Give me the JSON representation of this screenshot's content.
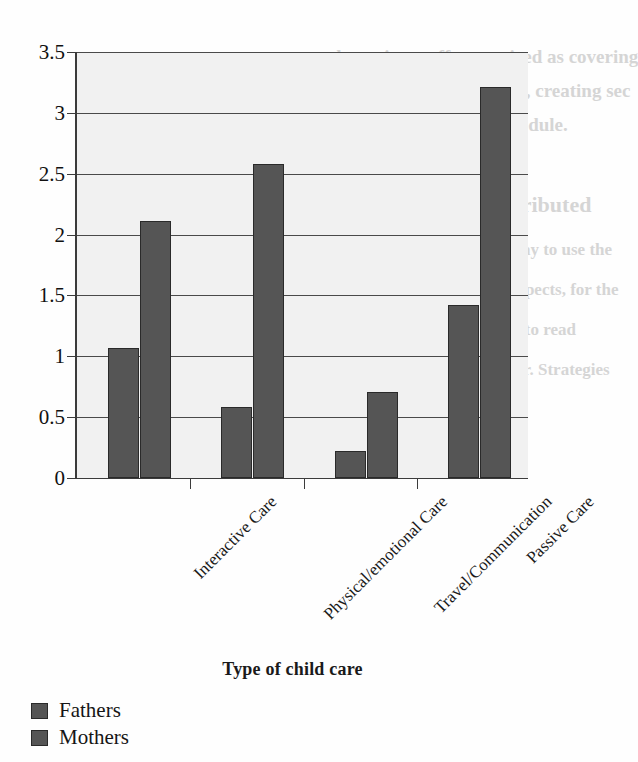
{
  "chart_data": {
    "type": "bar",
    "title": "",
    "xlabel": "Type of child care",
    "ylabel": "",
    "categories": [
      "Interactive Care",
      "Physical/emotional Care",
      "Travel/Communication",
      "Passive Care"
    ],
    "series": [
      {
        "name": "Fathers",
        "values": [
          1.07,
          0.58,
          0.22,
          1.42
        ]
      },
      {
        "name": "Mothers",
        "values": [
          2.11,
          2.58,
          0.71,
          3.21
        ]
      }
    ],
    "ylim": [
      0,
      3.5
    ],
    "ytick_labels": [
      "0",
      "0.5",
      "1",
      "1.5",
      "2",
      "2.5",
      "3",
      "3.5"
    ],
    "ytick_values": [
      0,
      0.5,
      1,
      1.5,
      2,
      2.5,
      3,
      3.5
    ],
    "grid": true,
    "legend_position": "bottom-left",
    "bar_color": "#555555",
    "plot_background": "#f1f1f1",
    "axis_color": "#3b3b3b"
  },
  "legend": {
    "items": [
      {
        "label": "Fathers"
      },
      {
        "label": "Mothers"
      }
    ]
  },
  "axis": {
    "x_title": "Type of child care"
  },
  "background_text": {
    "line1": "the acting staff recognized as covering",
    "line2": "ful and are easier to learn, creating sec",
    "line3": "forming a provision module.",
    "line4": "tical and Patient distributed",
    "line5": "meaning and report, the way to use the",
    "line6": "ur and present technical aspects, for the",
    "line7": "tion of there is to see what to read",
    "line8": "and sufficient in particular. Strategies"
  }
}
